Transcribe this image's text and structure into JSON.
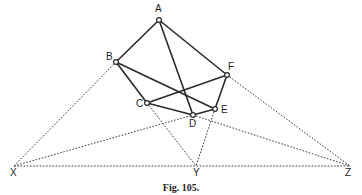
{
  "figure": {
    "caption": "Fig. 105.",
    "points": {
      "A": {
        "label": "A",
        "x": 159,
        "y": 20,
        "lx": 155,
        "ly": 12,
        "marker": true
      },
      "B": {
        "label": "B",
        "x": 116,
        "y": 62,
        "lx": 106,
        "ly": 60,
        "marker": true
      },
      "C": {
        "label": "C",
        "x": 147,
        "y": 103,
        "lx": 136,
        "ly": 107,
        "marker": true
      },
      "D": {
        "label": "D",
        "x": 193,
        "y": 115,
        "lx": 189,
        "ly": 127,
        "marker": true
      },
      "E": {
        "label": "E",
        "x": 215,
        "y": 109,
        "lx": 221,
        "ly": 113,
        "marker": true
      },
      "F": {
        "label": "F",
        "x": 227,
        "y": 75,
        "lx": 228,
        "ly": 70,
        "marker": true
      },
      "X": {
        "label": "X",
        "x": 14,
        "y": 166,
        "lx": 10,
        "ly": 176,
        "marker": false
      },
      "Y": {
        "label": "Y",
        "x": 196,
        "y": 166,
        "lx": 193,
        "ly": 176,
        "marker": false
      },
      "Z": {
        "label": "Z",
        "x": 350,
        "y": 166,
        "lx": 345,
        "ly": 176,
        "marker": false
      }
    },
    "solid_segments": [
      [
        "A",
        "B"
      ],
      [
        "A",
        "F"
      ],
      [
        "A",
        "D"
      ],
      [
        "B",
        "C"
      ],
      [
        "B",
        "E"
      ],
      [
        "C",
        "F"
      ],
      [
        "C",
        "D"
      ],
      [
        "D",
        "E"
      ],
      [
        "E",
        "F"
      ]
    ],
    "dotted_segments": [
      [
        "X",
        "B"
      ],
      [
        "X",
        "D"
      ],
      [
        "X",
        "Z"
      ],
      [
        "C",
        "Y"
      ],
      [
        "E",
        "Y"
      ],
      [
        "F",
        "Z"
      ],
      [
        "D",
        "Z"
      ]
    ]
  }
}
